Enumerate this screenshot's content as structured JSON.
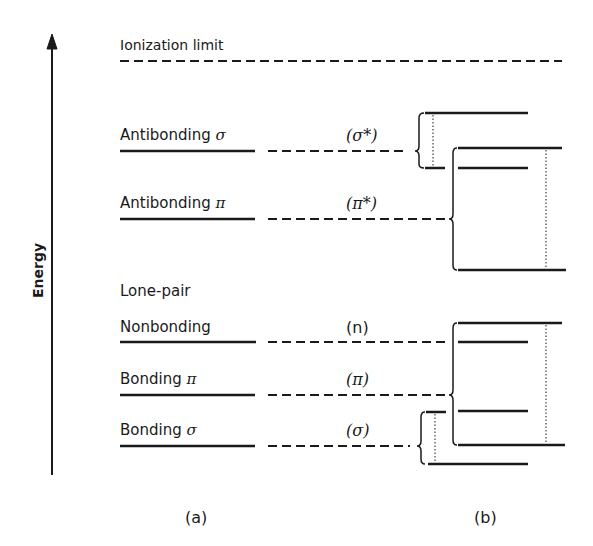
{
  "axis": {
    "label": "Energy"
  },
  "ionization": {
    "label": "Ionization limit"
  },
  "levels": [
    {
      "name": "Antibonding",
      "greek": "σ",
      "symbol": "(σ*)"
    },
    {
      "name": "Antibonding",
      "greek": "π",
      "symbol": "(π*)"
    },
    {
      "name": "Lone-pair",
      "greek": "",
      "symbol": ""
    },
    {
      "name": "Nonbonding",
      "greek": "",
      "symbol": "(n)"
    },
    {
      "name": "Bonding",
      "greek": "π",
      "symbol": "(π)"
    },
    {
      "name": "Bonding",
      "greek": "σ",
      "symbol": "(σ)"
    }
  ],
  "panels": {
    "a": "(a)",
    "b": "(b)"
  }
}
